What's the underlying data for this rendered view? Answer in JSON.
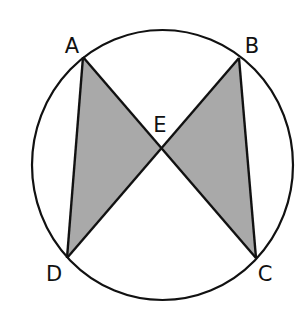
{
  "diagram": {
    "type": "circle-with-intersecting-chords",
    "colors": {
      "stroke": "#111111",
      "shade": "#a9a9a9",
      "background": "#ffffff"
    },
    "circle": {
      "cx": 162.5,
      "cy": 165,
      "rx": 130.5,
      "ry": 135
    },
    "points": {
      "A": {
        "x": 83,
        "y": 57,
        "label": "A"
      },
      "B": {
        "x": 239,
        "y": 58,
        "label": "B"
      },
      "C": {
        "x": 256,
        "y": 258,
        "label": "C"
      },
      "D": {
        "x": 67,
        "y": 258,
        "label": "D"
      },
      "E": {
        "x": 161,
        "y": 149,
        "label": "E"
      }
    },
    "chords": [
      "AC",
      "BD",
      "AD",
      "BC"
    ],
    "shaded_regions": [
      "triangle ADE",
      "triangle BCE"
    ]
  }
}
